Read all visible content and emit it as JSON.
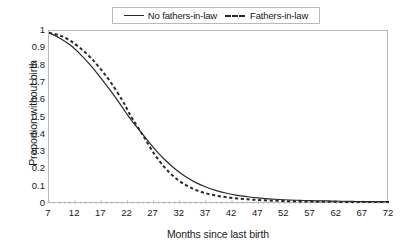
{
  "chart_data": {
    "type": "line",
    "title": "",
    "xlabel": "Months since last birth",
    "ylabel": "Proportion without birth",
    "xlim": [
      7,
      72
    ],
    "ylim": [
      0,
      1
    ],
    "grid": false,
    "legend_position": "top-center",
    "xticks": [
      "7",
      "12",
      "17",
      "22",
      "27",
      "32",
      "37",
      "42",
      "47",
      "52",
      "57",
      "62",
      "67",
      "72"
    ],
    "yticks": [
      "1",
      "0.9",
      "0.8",
      "0.7",
      "0.6",
      "0.5",
      "0.4",
      "0.3",
      "0.2",
      "0.1",
      "0"
    ],
    "x": [
      7,
      9,
      11,
      13,
      15,
      17,
      19,
      21,
      22,
      23,
      25,
      27,
      29,
      31,
      33,
      35,
      37,
      39,
      41,
      43,
      45,
      47,
      49,
      51,
      53,
      55,
      57,
      59,
      61,
      63,
      65,
      67,
      69,
      72
    ],
    "series": [
      {
        "name": "No fathers-in-law",
        "style": "solid",
        "color": "#2a2a2a",
        "values": [
          0.99,
          0.96,
          0.92,
          0.865,
          0.8,
          0.725,
          0.645,
          0.56,
          0.515,
          0.475,
          0.4,
          0.325,
          0.26,
          0.205,
          0.16,
          0.125,
          0.098,
          0.077,
          0.062,
          0.05,
          0.042,
          0.035,
          0.03,
          0.026,
          0.023,
          0.021,
          0.019,
          0.018,
          0.017,
          0.016,
          0.015,
          0.014,
          0.014,
          0.013
        ]
      },
      {
        "name": "Fathers-in-law",
        "style": "dashed",
        "color": "#2a2a2a",
        "values": [
          0.99,
          0.975,
          0.945,
          0.9,
          0.845,
          0.775,
          0.695,
          0.6,
          0.545,
          0.49,
          0.395,
          0.295,
          0.215,
          0.155,
          0.112,
          0.082,
          0.062,
          0.048,
          0.039,
          0.032,
          0.027,
          0.023,
          0.02,
          0.018,
          0.016,
          0.015,
          0.014,
          0.013,
          0.013,
          0.012,
          0.012,
          0.011,
          0.011,
          0.011
        ]
      }
    ]
  },
  "legend": {
    "entries": [
      {
        "label": "No fathers-in-law",
        "style": "solid"
      },
      {
        "label": "Fathers-in-law",
        "style": "dashed"
      }
    ]
  },
  "axes": {
    "x_title": "Months since last birth",
    "y_title": "Proportion without birth"
  },
  "colors": {
    "line": "#2a2a2a",
    "frame": "#b9b9b9",
    "background": "#ffffff",
    "text": "#1a1a1a"
  }
}
